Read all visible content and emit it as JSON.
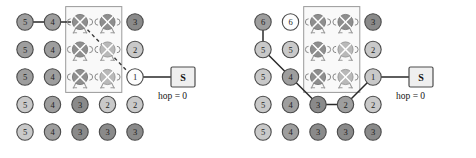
{
  "figure": {
    "panels": [
      {
        "id": "left",
        "name": "flooding-initial-state",
        "grid": {
          "cols": 5,
          "rows": 5,
          "cells": [
            [
              {
                "label": "5",
                "kind": "node",
                "shade": "mid"
              },
              {
                "label": "4",
                "kind": "node",
                "shade": "mid"
              },
              {
                "label": "",
                "kind": "robot",
                "shade": "dark"
              },
              {
                "label": "",
                "kind": "robot",
                "shade": "dark"
              },
              {
                "label": "3",
                "kind": "node",
                "shade": "dark"
              }
            ],
            [
              {
                "label": "5",
                "kind": "node",
                "shade": "mid"
              },
              {
                "label": "4",
                "kind": "node",
                "shade": "mid"
              },
              {
                "label": "",
                "kind": "robot",
                "shade": "dark"
              },
              {
                "label": "",
                "kind": "robot",
                "shade": "light"
              },
              {
                "label": "2",
                "kind": "node",
                "shade": "light"
              }
            ],
            [
              {
                "label": "5",
                "kind": "node",
                "shade": "mid"
              },
              {
                "label": "4",
                "kind": "node",
                "shade": "mid"
              },
              {
                "label": "",
                "kind": "robot",
                "shade": "dark"
              },
              {
                "label": "",
                "kind": "robot",
                "shade": "light"
              },
              {
                "label": "1",
                "kind": "node",
                "shade": "white"
              }
            ],
            [
              {
                "label": "5",
                "kind": "node",
                "shade": "light"
              },
              {
                "label": "4",
                "kind": "node",
                "shade": "mid"
              },
              {
                "label": "3",
                "kind": "node",
                "shade": "dark"
              },
              {
                "label": "2",
                "kind": "node",
                "shade": "light"
              },
              {
                "label": "2",
                "kind": "node",
                "shade": "light"
              }
            ],
            [
              {
                "label": "5",
                "kind": "node",
                "shade": "light"
              },
              {
                "label": "4",
                "kind": "node",
                "shade": "mid"
              },
              {
                "label": "3",
                "kind": "node",
                "shade": "dark"
              },
              {
                "label": "3",
                "kind": "node",
                "shade": "dark"
              },
              {
                "label": "3",
                "kind": "node",
                "shade": "dark"
              }
            ]
          ]
        },
        "obstacle_region": {
          "col_start": 2,
          "col_end": 3,
          "row_start": 0,
          "row_end": 2
        },
        "solid_edges": [
          {
            "from": [
              0,
              0
            ],
            "to": [
              0,
              1
            ]
          },
          {
            "from": [
              0,
              1
            ],
            "to_x_offset": 18,
            "to": [
              0,
              1
            ]
          }
        ],
        "dashed_path": [
          [
            0,
            2
          ],
          [
            2,
            4
          ]
        ],
        "sink": {
          "label": "S",
          "caption": "hop = 0",
          "attached_to": [
            2,
            4
          ]
        }
      },
      {
        "id": "right",
        "name": "flooding-propagated-state",
        "grid": {
          "cols": 5,
          "rows": 5,
          "cells": [
            [
              {
                "label": "6",
                "kind": "node",
                "shade": "mid"
              },
              {
                "label": "6",
                "kind": "node",
                "shade": "white"
              },
              {
                "label": "",
                "kind": "robot",
                "shade": "dark"
              },
              {
                "label": "",
                "kind": "robot",
                "shade": "dark"
              },
              {
                "label": "3",
                "kind": "node",
                "shade": "dark"
              }
            ],
            [
              {
                "label": "5",
                "kind": "node",
                "shade": "light"
              },
              {
                "label": "5",
                "kind": "node",
                "shade": "light"
              },
              {
                "label": "",
                "kind": "robot",
                "shade": "dark"
              },
              {
                "label": "",
                "kind": "robot",
                "shade": "light"
              },
              {
                "label": "2",
                "kind": "node",
                "shade": "light"
              }
            ],
            [
              {
                "label": "5",
                "kind": "node",
                "shade": "light"
              },
              {
                "label": "4",
                "kind": "node",
                "shade": "mid"
              },
              {
                "label": "",
                "kind": "robot",
                "shade": "dark"
              },
              {
                "label": "",
                "kind": "robot",
                "shade": "light"
              },
              {
                "label": "1",
                "kind": "node",
                "shade": "light"
              }
            ],
            [
              {
                "label": "5",
                "kind": "node",
                "shade": "light"
              },
              {
                "label": "4",
                "kind": "node",
                "shade": "mid"
              },
              {
                "label": "3",
                "kind": "node",
                "shade": "dark"
              },
              {
                "label": "2",
                "kind": "node",
                "shade": "mid"
              },
              {
                "label": "2",
                "kind": "node",
                "shade": "light"
              }
            ],
            [
              {
                "label": "5",
                "kind": "node",
                "shade": "light"
              },
              {
                "label": "4",
                "kind": "node",
                "shade": "mid"
              },
              {
                "label": "3",
                "kind": "node",
                "shade": "dark"
              },
              {
                "label": "3",
                "kind": "node",
                "shade": "dark"
              },
              {
                "label": "3",
                "kind": "node",
                "shade": "dark"
              }
            ]
          ]
        },
        "obstacle_region": {
          "col_start": 2,
          "col_end": 3,
          "row_start": 0,
          "row_end": 2
        },
        "route": [
          [
            0,
            0
          ],
          [
            1,
            0
          ],
          [
            2,
            1
          ],
          [
            3,
            2
          ],
          [
            3,
            3
          ],
          [
            2,
            4
          ]
        ],
        "sink": {
          "label": "S",
          "caption": "hop = 0",
          "attached_to": [
            2,
            4
          ]
        }
      }
    ],
    "colors": {
      "node_mid": "#9e9e9e",
      "node_light": "#c9c9c9",
      "node_dark": "#8a8a8a",
      "node_white": "#fdfdfd",
      "node_stroke": "#4a4a4a",
      "edge": "#2a2a2a",
      "box_stroke": "#9a9a9a",
      "sink_fill": "#efefef",
      "text": "#141414"
    }
  }
}
